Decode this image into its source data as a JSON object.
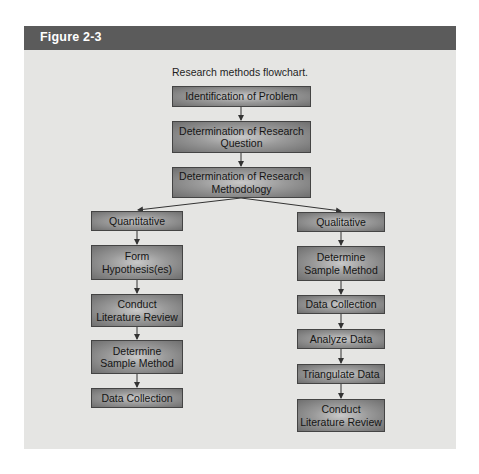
{
  "figure": {
    "label": "Figure 2-3",
    "caption": "Research methods flowchart.",
    "colors": {
      "header_bg": "#5b5b5b",
      "panel_bg": "#e5e5e3",
      "box_border": "#444444",
      "line": "#333333"
    }
  },
  "flow": {
    "top": [
      "Identification of Problem",
      "Determination of Research Question",
      "Determination of Research Methodology"
    ],
    "quantitative": {
      "label": "Quantitative",
      "steps": [
        "Form Hypothesis(es)",
        "Conduct Literature Review",
        "Determine Sample Method",
        "Data Collection"
      ]
    },
    "qualitative": {
      "label": "Qualitative",
      "steps": [
        "Determine Sample Method",
        "Data Collection",
        "Analyze Data",
        "Triangulate Data",
        "Conduct Literature Review"
      ]
    }
  }
}
